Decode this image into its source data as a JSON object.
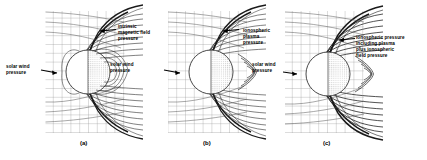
{
  "figure": {
    "background_color": "#ffffff",
    "grid_color": "#8c8c8c",
    "fieldline_color": "#1a1a1a",
    "planet_fill": "#ffffff",
    "planet_shadow": "#c9c9c9"
  },
  "panels": [
    {
      "id": "a",
      "caption": "(a)",
      "labels": [
        {
          "name": "solar-wind-pressure",
          "text": "solar wind\npressure",
          "side": "left"
        },
        {
          "name": "intrinsic-magnetic-field-pressure",
          "text": "intrinsic\nmagnetic field\npressure",
          "side": "right"
        }
      ]
    },
    {
      "id": "b",
      "caption": "(b)",
      "labels": [
        {
          "name": "solar-wind-pressure",
          "text": "solar wind\npressure",
          "side": "left"
        },
        {
          "name": "ionospheric-plasma-pressure",
          "text": "ionospheric\nplasma\npressure",
          "side": "right"
        }
      ]
    },
    {
      "id": "c",
      "caption": "(c)",
      "labels": [
        {
          "name": "solar-wind-pressure",
          "text": "solar wind\npressure",
          "side": "left"
        },
        {
          "name": "ionospheric-pressure-combined",
          "text": "ionospheric pressure\nincluding plasma\nplus ionospheric\nfield pressure",
          "side": "right"
        }
      ]
    }
  ]
}
